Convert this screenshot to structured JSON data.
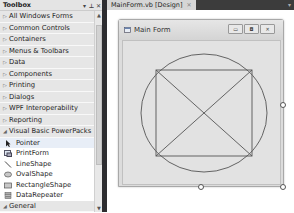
{
  "toolbox": {
    "title": "Toolbox",
    "header_buttons": [
      "pin-dropdown",
      "pin",
      "close"
    ],
    "header_button_glyphs": [
      "▾",
      "⊥",
      "✕"
    ],
    "categories": [
      {
        "label": "All Windows Forms",
        "expanded": false
      },
      {
        "label": "Common Controls",
        "expanded": false
      },
      {
        "label": "Containers",
        "expanded": false
      },
      {
        "label": "Menus & Toolbars",
        "expanded": false
      },
      {
        "label": "Data",
        "expanded": false
      },
      {
        "label": "Components",
        "expanded": false
      },
      {
        "label": "Printing",
        "expanded": false
      },
      {
        "label": "Dialogs",
        "expanded": false
      },
      {
        "label": "WPF Interoperability",
        "expanded": false
      },
      {
        "label": "Reporting",
        "expanded": false
      },
      {
        "label": "Visual Basic PowerPacks",
        "expanded": true
      }
    ],
    "powerpacks_items": [
      {
        "label": "Pointer",
        "icon": "pointer-icon",
        "selected": true
      },
      {
        "label": "PrintForm",
        "icon": "printform-icon"
      },
      {
        "label": "LineShape",
        "icon": "lineshape-icon"
      },
      {
        "label": "OvalShape",
        "icon": "ovalshape-icon"
      },
      {
        "label": "RectangleShape",
        "icon": "rectangleshape-icon"
      },
      {
        "label": "DataRepeater",
        "icon": "datarepeater-icon"
      }
    ],
    "last_category": {
      "label": "General",
      "expanded": true
    },
    "collapsed_arrow": "▷",
    "expanded_arrow": "◢"
  },
  "designer": {
    "tab_label": "MainForm.vb [Design]",
    "tab_close": "✕",
    "tab_dropdown": "▾",
    "form": {
      "title": "Main Form",
      "buttons": {
        "minimize": "▭",
        "maximize": "◘",
        "close": "✕"
      }
    }
  },
  "colors": {
    "splitter": "#2d2d30",
    "tabbar": "#3c3c3c",
    "form_canvas": "#e2e2e2",
    "shape_stroke": "#555555"
  }
}
